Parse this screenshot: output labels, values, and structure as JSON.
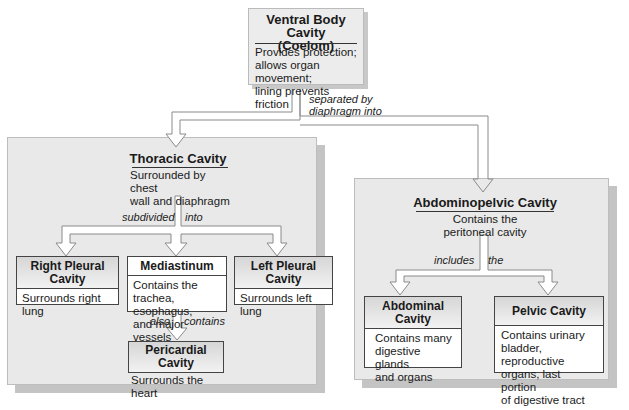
{
  "ventral": {
    "title_line1": "Ventral Body Cavity",
    "title_line2": "(Coelom)",
    "desc": [
      "Provides protection;",
      "allows organ movement;",
      "lining prevents friction"
    ]
  },
  "connector_top": {
    "label_line1": "separated by",
    "label_line2": "diaphragm into"
  },
  "thoracic": {
    "title": "Thoracic Cavity",
    "desc": [
      "Surrounded by chest",
      "wall and diaphragm"
    ],
    "connector_label_left": "subdivided",
    "connector_label_right": "into",
    "children": [
      {
        "title": "Right Pleural Cavity",
        "desc": [
          "Surrounds right",
          "lung"
        ]
      },
      {
        "title": "Mediastinum",
        "desc": [
          "Contains the",
          "trachea, esophagus,",
          "and major vessels"
        ]
      },
      {
        "title": "Left Pleural Cavity",
        "desc": [
          "Surrounds left",
          "lung"
        ]
      }
    ],
    "mediastinum_connector_left": "also",
    "mediastinum_connector_right": "contains",
    "pericardial": {
      "title": "Pericardial Cavity",
      "desc": "Surrounds the heart"
    }
  },
  "abdominopelvic": {
    "title": "Abdominopelvic Cavity",
    "desc": [
      "Contains the",
      "peritoneal cavity"
    ],
    "connector_label_left": "includes",
    "connector_label_right": "the",
    "children": [
      {
        "title_line1": "Abdominal",
        "title_line2": "Cavity",
        "desc": [
          "Contains many",
          "digestive glands",
          "and organs"
        ]
      },
      {
        "title": "Pelvic Cavity",
        "desc": [
          "Contains urinary",
          "bladder, reproductive",
          "organs, last portion",
          "of digestive tract"
        ]
      }
    ]
  },
  "colors": {
    "panel_bg": "#e9e9e9",
    "panel_shadow": "#c4c4c4",
    "box_border": "#444444",
    "arrow_stroke": "#8a8a8a"
  }
}
